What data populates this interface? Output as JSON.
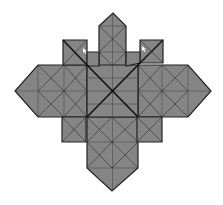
{
  "figure": {
    "colors": {
      "fill": "#858585",
      "stroke": "#222222",
      "background": "#ffffff"
    },
    "center": [
      112,
      91
    ],
    "pieces": [
      {
        "name": "top-column",
        "points": "99,26 113,13 126,26 126,66 99,66"
      },
      {
        "name": "bottom-column",
        "points": "87,117 138,117 138,168 112,191 87,168"
      },
      {
        "name": "left-arm",
        "points": "38,65 87,65 87,117 38,117 15,91"
      },
      {
        "name": "right-arm",
        "points": "138,65 188,65 211,91 188,117 138,117"
      },
      {
        "name": "center-block",
        "points": "87,65 138,65 138,117 87,117"
      },
      {
        "name": "small-square-top-left",
        "points": "63,40 87,40 87,65 63,65"
      },
      {
        "name": "small-square-top-right",
        "points": "140,40 163,40 163,63 140,63"
      },
      {
        "name": "small-square-bottom-left",
        "points": "62,117 86,117 86,142 62,142"
      },
      {
        "name": "small-square-bottom-right",
        "points": "137,117 162,117 162,142 137,142"
      },
      {
        "name": "connector-top-left",
        "points": "87,52 99,52 99,66 87,66"
      },
      {
        "name": "connector-top-right",
        "points": "126,52 140,52 140,63 126,66"
      }
    ],
    "markers": [
      {
        "name": "cursor-mark-left",
        "x": 83,
        "y": 48
      },
      {
        "name": "cursor-mark-right",
        "x": 142,
        "y": 46
      }
    ]
  }
}
